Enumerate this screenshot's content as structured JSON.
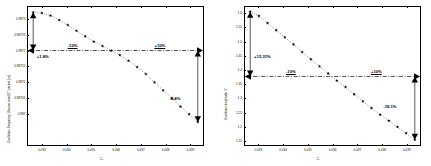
{
  "figure": {
    "panels": [
      {
        "id": "left",
        "chart_data": {
          "type": "scatter",
          "title": "",
          "subtitle": "",
          "xlabel": "C₁",
          "ylabel": "Oscillation Frequency (Source ratio)/2 * period, [ns]",
          "xlim": [
            0.0324,
            0.03955
          ],
          "ylim": [
            0.9869,
            0.98734
          ],
          "xticks": [
            0.033,
            0.034,
            0.035,
            0.036,
            0.037,
            0.038,
            0.039
          ],
          "xticklabels": [
            "0.033",
            "0.034",
            "0.035",
            "0.036",
            "0.037",
            "0.038",
            "0.039"
          ],
          "yticks": [
            0.987,
            0.98705,
            0.9871,
            0.98715,
            0.9872,
            0.98725,
            0.9873
          ],
          "yticklabels": [
            "0.987",
            "0.98705",
            "0.9871",
            "0.98715",
            "0.9872",
            "0.98725",
            "0.9873"
          ],
          "grid": false,
          "legend": null,
          "marker": "star",
          "trendline": "dotted",
          "series": [
            {
              "name": "oscillation frequency vs C1",
              "x": [
                0.03265,
                0.033,
                0.03335,
                0.0337,
                0.03405,
                0.0344,
                0.03475,
                0.0351,
                0.03545,
                0.0358,
                0.03615,
                0.0365,
                0.03685,
                0.0372,
                0.03755,
                0.0379,
                0.03825,
                0.0386,
                0.03895,
                0.0393
              ],
              "y": [
                0.98732,
                0.987318,
                0.98731,
                0.987296,
                0.98728,
                0.987262,
                0.987245,
                0.987228,
                0.987214,
                0.9872,
                0.987186,
                0.987168,
                0.987148,
                0.987126,
                0.9871,
                0.987075,
                0.98705,
                0.987024,
                0.987,
                0.986975
              ]
            }
          ],
          "reference_line": {
            "type": "dash-dot horizontal",
            "y": 0.9872,
            "labels": [
              {
                "text": "-10%",
                "x_frac": 0.23
              },
              {
                "text": "+10%",
                "x_frac": 0.72
              }
            ]
          },
          "annotations": [
            {
              "text": "+1.8%",
              "kind": "deviation-up",
              "x_frac": 0.055,
              "y_frac": 0.345
            },
            {
              "text": "-3.4%",
              "kind": "deviation-down",
              "x_frac": 0.805,
              "y_frac": 0.645
            }
          ]
        }
      },
      {
        "id": "right",
        "chart_data": {
          "type": "scatter",
          "title": "",
          "subtitle": "",
          "xlabel": "C₁",
          "ylabel": "Oscillation amplitude, V",
          "xlim": [
            0.0324,
            0.03955
          ],
          "ylim": [
            1.133,
            1.625
          ],
          "xticks": [
            0.033,
            0.034,
            0.035,
            0.036,
            0.037,
            0.038,
            0.039
          ],
          "xticklabels": [
            "0.033",
            "0.034",
            "0.035",
            "0.036",
            "0.037",
            "0.038",
            "0.039"
          ],
          "yticks": [
            1.15,
            1.2,
            1.25,
            1.3,
            1.35,
            1.4,
            1.45,
            1.5,
            1.55,
            1.6
          ],
          "yticklabels": [
            "1.15",
            "1.2",
            "1.25",
            "1.3",
            "1.35",
            "1.4",
            "1.45",
            "1.5",
            "1.55",
            "1.6"
          ],
          "grid": false,
          "legend": null,
          "marker": "star",
          "trendline": "dotted",
          "series": [
            {
              "name": "oscillation amplitude vs C1",
              "x": [
                0.03265,
                0.033,
                0.03335,
                0.0337,
                0.03405,
                0.0344,
                0.03475,
                0.0351,
                0.03545,
                0.0358,
                0.03615,
                0.0365,
                0.03685,
                0.0372,
                0.03755,
                0.0379,
                0.03825,
                0.0386,
                0.03895,
                0.0393
              ],
              "y": [
                1.605,
                1.59,
                1.565,
                1.54,
                1.515,
                1.49,
                1.463,
                1.438,
                1.413,
                1.388,
                1.363,
                1.34,
                1.315,
                1.29,
                1.266,
                1.243,
                1.222,
                1.2,
                1.178,
                1.155
              ]
            }
          ],
          "reference_line": {
            "type": "dash-dot horizontal",
            "y": 1.3775,
            "labels": [
              {
                "text": "-10%",
                "x_frac": 0.24
              },
              {
                "text": "+10%",
                "x_frac": 0.72
              }
            ]
          },
          "annotations": [
            {
              "text": "+15.31%",
              "kind": "deviation-up",
              "x_frac": 0.06,
              "y_frac": 0.345
            },
            {
              "text": "-18.1%",
              "kind": "deviation-down",
              "x_frac": 0.79,
              "y_frac": 0.7
            }
          ]
        }
      }
    ]
  },
  "colors": {
    "axis": "#000000",
    "marker": "#000000",
    "reference_line": "#000000",
    "background": "#ffffff"
  }
}
